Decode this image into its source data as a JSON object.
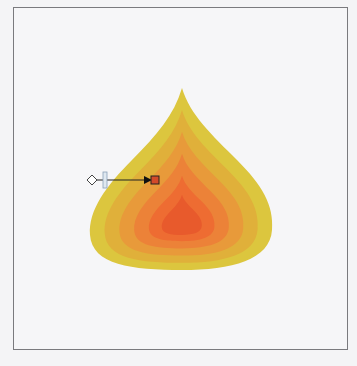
{
  "artboard": {
    "border_color": "#7a7a7e",
    "background": "#f6f6f8"
  },
  "drop": {
    "layers": [
      {
        "name": "layer-1",
        "color": "#dcc63e",
        "scale": 1.0
      },
      {
        "name": "layer-2",
        "color": "#e0b03a",
        "scale": 0.84
      },
      {
        "name": "layer-3",
        "color": "#e89a3a",
        "scale": 0.68
      },
      {
        "name": "layer-4",
        "color": "#ec8238",
        "scale": 0.52
      },
      {
        "name": "layer-5",
        "color": "#ee6c32",
        "scale": 0.36
      },
      {
        "name": "layer-6",
        "color": "#e85a2c",
        "scale": 0.22
      }
    ]
  },
  "gradient_slider": {
    "start_handle": "diamond",
    "midpoint_handle": "bar",
    "end_handle": "square",
    "end_color": "#d24a2a"
  }
}
